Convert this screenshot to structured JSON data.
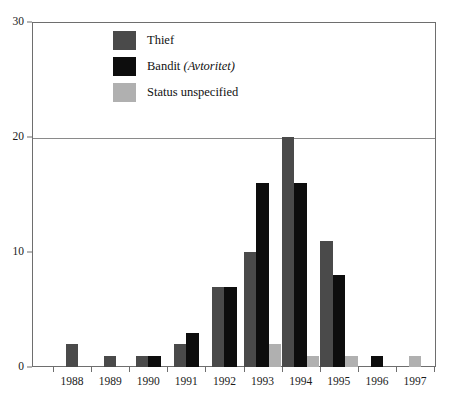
{
  "chart_data": {
    "type": "bar",
    "title": "",
    "xlabel": "",
    "ylabel": "",
    "ylim": [
      0,
      30
    ],
    "yticks": [
      0,
      10,
      20,
      30
    ],
    "ytick_labels": [
      "0",
      "10",
      "20",
      "30"
    ],
    "gridlines_at": [
      20,
      30
    ],
    "grid": true,
    "legend_position": "upper-left-inside",
    "categories": [
      "1988",
      "1989",
      "1990",
      "1991",
      "1992",
      "1993",
      "1994",
      "1995",
      "1996",
      "1997"
    ],
    "series": [
      {
        "name": "Thief",
        "color": "#4a4a4a",
        "values": [
          2,
          1,
          1,
          2,
          7,
          10,
          20,
          11,
          0,
          0
        ]
      },
      {
        "name": "Bandit (Avtoritet)",
        "color": "#0d0d0d",
        "values": [
          0,
          0,
          1,
          3,
          7,
          16,
          16,
          8,
          1,
          0
        ]
      },
      {
        "name": "Status unspecified",
        "color": "#b0b0b0",
        "values": [
          0,
          0,
          0,
          0,
          0,
          2,
          1,
          1,
          0,
          1
        ]
      }
    ]
  },
  "legend": {
    "items": [
      {
        "label": "Thief",
        "label_italic": "",
        "color": "#4a4a4a"
      },
      {
        "label": "Bandit ",
        "label_italic": "(Avtoritet)",
        "color": "#0d0d0d"
      },
      {
        "label": "Status unspecified",
        "label_italic": "",
        "color": "#b0b0b0"
      }
    ]
  },
  "axes": {
    "y_tick_labels": [
      "30",
      "20",
      "10",
      "0"
    ],
    "x_tick_labels": [
      "1988",
      "1989",
      "1990",
      "1991",
      "1992",
      "1993",
      "1994",
      "1995",
      "1996",
      "1997"
    ]
  },
  "colors": {
    "frame": "#6e6e6e",
    "gridline": "#8a8a8a",
    "text": "#1a1a1a",
    "background": "#ffffff"
  }
}
